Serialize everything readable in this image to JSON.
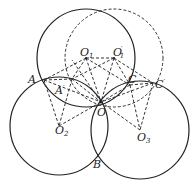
{
  "diagram": {
    "type": "geometry-construction",
    "solid_circles": [
      {
        "name": "circle-O1",
        "cx": 86,
        "cy": 58,
        "r": 49
      },
      {
        "name": "circle-O2",
        "cx": 59,
        "cy": 126,
        "r": 49
      },
      {
        "name": "circle-O3",
        "cx": 140,
        "cy": 130,
        "r": 49
      }
    ],
    "dashed_circles": [
      {
        "name": "circle-O1-prime",
        "cx": 114,
        "cy": 58,
        "r": 49
      }
    ],
    "points": {
      "O1": [
        86,
        58
      ],
      "O1p": [
        114,
        58
      ],
      "O2": [
        59,
        126
      ],
      "O3": [
        140,
        130
      ],
      "O": [
        101,
        102
      ],
      "A": [
        44,
        80
      ],
      "Ap": [
        72,
        79
      ],
      "C": [
        130,
        85
      ],
      "Cp": [
        153,
        83
      ],
      "B": [
        97,
        156
      ]
    },
    "labels": {
      "A": "A",
      "A_prime": "A",
      "prime": "′",
      "C": "C",
      "C_prime": "C",
      "O": "O",
      "B": "B",
      "O1": "O",
      "O1_sub": "1",
      "O1_prime": "O",
      "O1_prime_sub": "1",
      "O2": "O",
      "O2_sub": "2",
      "O3": "O",
      "O3_sub": "3"
    }
  }
}
